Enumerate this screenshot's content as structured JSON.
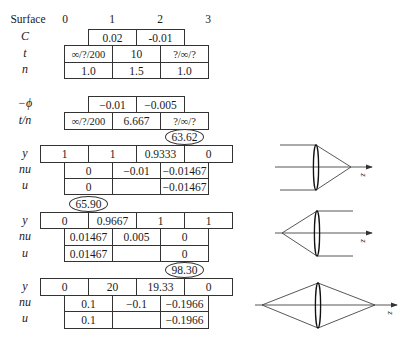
{
  "header": {
    "row_label": "Surface",
    "surfaces": [
      "0",
      "1",
      "2",
      "3"
    ]
  },
  "lens_data": {
    "C": {
      "label": "C",
      "values": [
        "0.02",
        "-0.01"
      ]
    },
    "t": {
      "label": "t",
      "values": [
        "∞/?/200",
        "10",
        "?/∞/?"
      ]
    },
    "n": {
      "label": "n",
      "values": [
        "1.0",
        "1.5",
        "1.0"
      ]
    },
    "neg_phi": {
      "label": "−ϕ",
      "values": [
        "−0.01",
        "−0.005"
      ]
    },
    "t_over_n": {
      "label": "t/n",
      "values": [
        "∞/?/200",
        "6.667",
        "?/∞/?"
      ]
    }
  },
  "traces": [
    {
      "circled_value": "63.62",
      "y": {
        "label": "y",
        "values": [
          "1",
          "1",
          "0.9333",
          "0"
        ]
      },
      "nu": {
        "label": "nu",
        "values": [
          "0",
          "−0.01",
          "−0.01467"
        ]
      },
      "u": {
        "label": "u",
        "values": [
          "0",
          "",
          "−0.01467"
        ]
      }
    },
    {
      "circled_value": "65.90",
      "y": {
        "label": "y",
        "values": [
          "0",
          "0.9667",
          "1",
          "1"
        ]
      },
      "nu": {
        "label": "nu",
        "values": [
          "0.01467",
          "0.005",
          "0"
        ]
      },
      "u": {
        "label": "u",
        "values": [
          "0.01467",
          "",
          "0"
        ]
      }
    },
    {
      "circled_value": "98.30",
      "y": {
        "label": "y",
        "values": [
          "0",
          "20",
          "19.33",
          "0"
        ]
      },
      "nu": {
        "label": "nu",
        "values": [
          "0.1",
          "−0.1",
          "−0.1966"
        ]
      },
      "u": {
        "label": "u",
        "values": [
          "0.1",
          "",
          "−0.1966"
        ]
      }
    }
  ],
  "diagrams": [
    {
      "name": "object-at-infinity",
      "axis_label": "z"
    },
    {
      "name": "image-at-infinity",
      "axis_label": "z"
    },
    {
      "name": "finite-conjugates",
      "axis_label": "z"
    }
  ]
}
